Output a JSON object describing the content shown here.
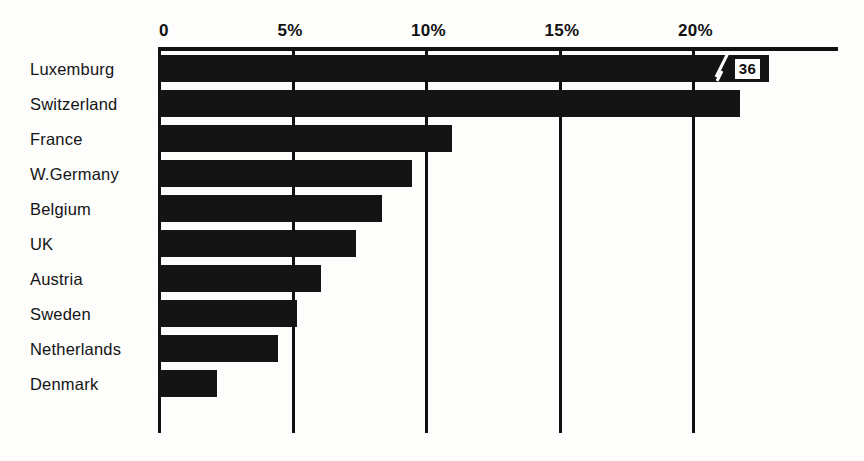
{
  "chart_data": {
    "type": "bar",
    "orientation": "horizontal",
    "title": "",
    "xlabel": "",
    "ylabel": "",
    "xlim": [
      0,
      25.5
    ],
    "grid": true,
    "legend": false,
    "axis_position": "top",
    "xticks": [
      {
        "value": 0,
        "label": "0"
      },
      {
        "value": 5,
        "label": "5%"
      },
      {
        "value": 10,
        "label": "10%"
      },
      {
        "value": 15,
        "label": "15%"
      },
      {
        "value": 20,
        "label": "20%"
      }
    ],
    "categories": [
      "Luxemburg",
      "Switzerland",
      "France",
      "W.Germany",
      "Belgium",
      "UK",
      "Austria",
      "Sweden",
      "Netherlands",
      "Denmark"
    ],
    "values": [
      36,
      21.8,
      11.0,
      9.5,
      8.4,
      7.4,
      6.1,
      5.2,
      4.5,
      2.2
    ],
    "bars": [
      {
        "category": "Luxemburg",
        "value": 36,
        "display_value": "36",
        "truncated": true,
        "drawn_to": 22.9
      },
      {
        "category": "Switzerland",
        "value": 21.8,
        "display_value": "",
        "truncated": false,
        "drawn_to": 21.8
      },
      {
        "category": "France",
        "value": 11.0,
        "display_value": "",
        "truncated": false,
        "drawn_to": 11.0
      },
      {
        "category": "W.Germany",
        "value": 9.5,
        "display_value": "",
        "truncated": false,
        "drawn_to": 9.5
      },
      {
        "category": "Belgium",
        "value": 8.4,
        "display_value": "",
        "truncated": false,
        "drawn_to": 8.4
      },
      {
        "category": "UK",
        "value": 7.4,
        "display_value": "",
        "truncated": false,
        "drawn_to": 7.4
      },
      {
        "category": "Austria",
        "value": 6.1,
        "display_value": "",
        "truncated": false,
        "drawn_to": 6.1
      },
      {
        "category": "Sweden",
        "value": 5.2,
        "display_value": "",
        "truncated": false,
        "drawn_to": 5.2
      },
      {
        "category": "Netherlands",
        "value": 4.5,
        "display_value": "",
        "truncated": false,
        "drawn_to": 4.5
      },
      {
        "category": "Denmark",
        "value": 2.2,
        "display_value": "",
        "truncated": false,
        "drawn_to": 2.2
      }
    ],
    "colors": {
      "bar": "#141414",
      "axis": "#111111",
      "background": "#fdfdfc",
      "label": "#141414",
      "value_box_bg": "#ffffff",
      "value_box_text": "#101010"
    }
  },
  "geometry": {
    "origin_x": 158,
    "px_per_unit": 26.7,
    "row_pitch": 35,
    "bar_height": 27,
    "plot_top": 51,
    "axis_y": 47,
    "axis_width": 680
  }
}
